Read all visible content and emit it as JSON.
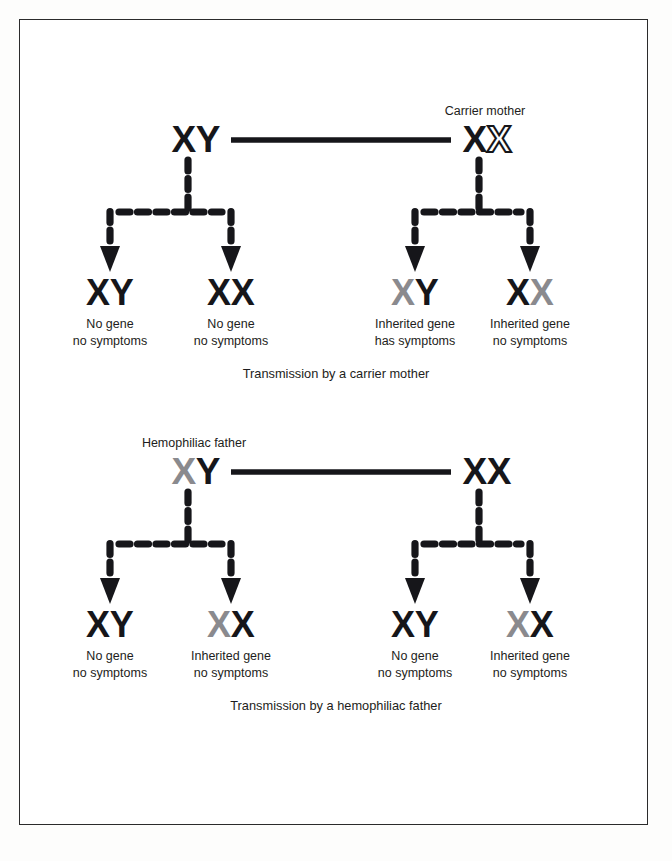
{
  "document": {
    "title": "X-linked recessive inheritance (hemophilia) diagram",
    "background_color": "#fdfdfc",
    "border_color": "#2b2b2b"
  },
  "legend_colors": {
    "normal_allele": "#16161a",
    "affected_allele": "#8a8a8e",
    "carrier_allele_outline": "#16161a",
    "carrier_allele_fill": "#ffffff"
  },
  "panels": [
    {
      "id": "carrier-mother-panel",
      "caption": "Transmission by a carrier mother",
      "parents": [
        {
          "id": "father",
          "label": "",
          "alleles": [
            {
              "letter": "X",
              "state": "normal"
            },
            {
              "letter": "Y",
              "state": "normal"
            }
          ]
        },
        {
          "id": "mother",
          "label": "Carrier mother",
          "alleles": [
            {
              "letter": "X",
              "state": "normal"
            },
            {
              "letter": "X",
              "state": "carrier"
            }
          ]
        }
      ],
      "offspring": [
        {
          "id": "child-1",
          "alleles": [
            {
              "letter": "X",
              "state": "normal"
            },
            {
              "letter": "Y",
              "state": "normal"
            }
          ],
          "text_line1": "No gene",
          "text_line2": "no symptoms"
        },
        {
          "id": "child-2",
          "alleles": [
            {
              "letter": "X",
              "state": "normal"
            },
            {
              "letter": "X",
              "state": "normal"
            }
          ],
          "text_line1": "No gene",
          "text_line2": "no symptoms"
        },
        {
          "id": "child-3",
          "alleles": [
            {
              "letter": "X",
              "state": "affected"
            },
            {
              "letter": "Y",
              "state": "normal"
            }
          ],
          "text_line1": "Inherited gene",
          "text_line2": "has symptoms"
        },
        {
          "id": "child-4",
          "alleles": [
            {
              "letter": "X",
              "state": "normal"
            },
            {
              "letter": "X",
              "state": "affected"
            }
          ],
          "text_line1": "Inherited gene",
          "text_line2": "no symptoms"
        }
      ]
    },
    {
      "id": "hemophiliac-father-panel",
      "caption": "Transmission by a hemophiliac father",
      "parents": [
        {
          "id": "father",
          "label": "Hemophiliac father",
          "alleles": [
            {
              "letter": "X",
              "state": "affected"
            },
            {
              "letter": "Y",
              "state": "normal"
            }
          ]
        },
        {
          "id": "mother",
          "label": "",
          "alleles": [
            {
              "letter": "X",
              "state": "normal"
            },
            {
              "letter": "X",
              "state": "normal"
            }
          ]
        }
      ],
      "offspring": [
        {
          "id": "child-1",
          "alleles": [
            {
              "letter": "X",
              "state": "normal"
            },
            {
              "letter": "Y",
              "state": "normal"
            }
          ],
          "text_line1": "No gene",
          "text_line2": "no symptoms"
        },
        {
          "id": "child-2",
          "alleles": [
            {
              "letter": "X",
              "state": "affected"
            },
            {
              "letter": "X",
              "state": "normal"
            }
          ],
          "text_line1": "Inherited gene",
          "text_line2": "no symptoms"
        },
        {
          "id": "child-3",
          "alleles": [
            {
              "letter": "X",
              "state": "normal"
            },
            {
              "letter": "Y",
              "state": "normal"
            }
          ],
          "text_line1": "No gene",
          "text_line2": "no symptoms"
        },
        {
          "id": "child-4",
          "alleles": [
            {
              "letter": "X",
              "state": "affected"
            },
            {
              "letter": "X",
              "state": "normal"
            }
          ],
          "text_line1": "Inherited gene",
          "text_line2": "no symptoms"
        }
      ]
    }
  ],
  "geometry": {
    "panel_tops": [
      96,
      428
    ],
    "parent_y": 152,
    "parent_father_x": 196,
    "parent_mother_x": 487,
    "mating_line_y": 140,
    "mating_line_x1": 231,
    "mating_line_x2": 451,
    "offspring_x": [
      110,
      231,
      415,
      530
    ],
    "offspring_y": 305,
    "text_y1": 328,
    "text_y2": 345,
    "caption_y": 378
  }
}
